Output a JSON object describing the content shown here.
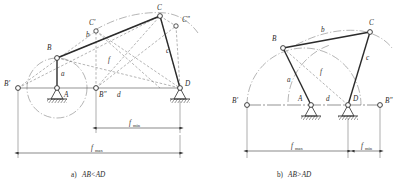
{
  "figure": {
    "title_a": "a) AB<AD",
    "title_b": "b) AB>AD",
    "caption_a_prefix": "a)",
    "caption_a_expr": "AB<AD",
    "caption_b_prefix": "b)",
    "caption_b_expr": "AB>AD",
    "line_color": "#3a3a3a",
    "dash_color": "#5a5a5a",
    "ground_color": "#2b2b2b",
    "background": "#ffffff"
  },
  "diagram_a": {
    "name": "four-bar-linkage-ab-lt-ad",
    "labels": {
      "B": "B",
      "B_prime": "B'",
      "B_dprime": "B\"",
      "C": "C",
      "C_prime": "C'",
      "C_dprime": "C\"",
      "A": "A",
      "D": "D",
      "a": "a",
      "b": "b",
      "c": "c",
      "d": "d",
      "f": "f",
      "f_min": "f",
      "f_min_sub": "min",
      "f_max": "f",
      "f_max_sub": "max"
    },
    "dimensions": {
      "f_min_label": "fmin",
      "f_max_label": "fmax"
    }
  },
  "diagram_b": {
    "name": "four-bar-linkage-ab-gt-ad",
    "labels": {
      "B": "B",
      "B_prime": "B'",
      "B_dprime": "B\"",
      "C": "C",
      "A": "A",
      "D": "D",
      "a": "a",
      "b": "b",
      "c": "c",
      "d": "d",
      "f": "f",
      "f_min": "f",
      "f_min_sub": "min",
      "f_max": "f",
      "f_max_sub": "max"
    },
    "dimensions": {
      "f_min_label": "fmin",
      "f_max_label": "fmax"
    }
  }
}
